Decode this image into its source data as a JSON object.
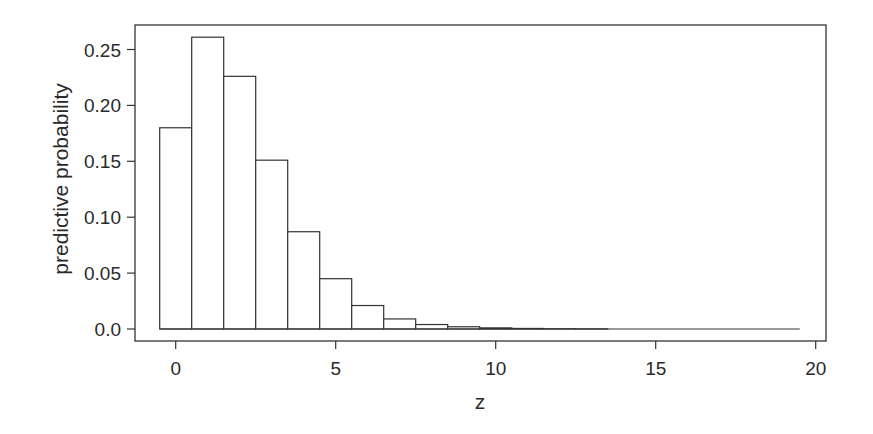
{
  "chart_data": {
    "type": "bar",
    "title": "",
    "xlabel": "z",
    "ylabel": "predictive probability",
    "categories": [
      0,
      1,
      2,
      3,
      4,
      5,
      6,
      7,
      8,
      9,
      10,
      11,
      12,
      13,
      14,
      15,
      16,
      17,
      18,
      19
    ],
    "values": [
      0.18,
      0.261,
      0.226,
      0.151,
      0.087,
      0.045,
      0.021,
      0.009,
      0.004,
      0.002,
      0.001,
      0.0005,
      0.0002,
      0.0001,
      0.0,
      0.0,
      0.0,
      0.0,
      0.0,
      0.0
    ],
    "xlim": [
      -1.8,
      20.4
    ],
    "ylim": [
      -0.011,
      0.272
    ],
    "xticks": [
      0,
      5,
      10,
      15,
      20
    ],
    "xtick_labels": [
      "0",
      "5",
      "10",
      "15",
      "20"
    ],
    "yticks": [
      0.0,
      0.05,
      0.1,
      0.15,
      0.2,
      0.25
    ],
    "ytick_labels": [
      "0.0",
      "0.05",
      "0.10",
      "0.15",
      "0.20",
      "0.25"
    ],
    "grid": false,
    "legend": null,
    "bar_fill": "#ffffff",
    "bar_stroke": "#333333"
  }
}
